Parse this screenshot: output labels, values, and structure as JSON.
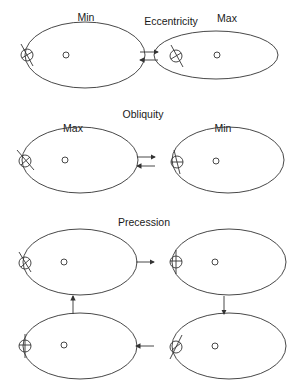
{
  "sections": {
    "eccentricity": {
      "title": "Eccentricity",
      "left_label": "Min",
      "right_label": "Max"
    },
    "obliquity": {
      "title": "Obliquity",
      "left_label": "Max",
      "right_label": "Min"
    },
    "precession": {
      "title": "Precession"
    }
  },
  "colors": {
    "line": "#333333",
    "background": "#ffffff"
  }
}
